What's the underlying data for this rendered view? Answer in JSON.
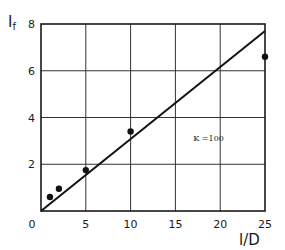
{
  "chart_data": {
    "type": "scatter",
    "title": "",
    "xlabel": "l/D",
    "ylabel": "I_f",
    "xlim": [
      0,
      25
    ],
    "ylim": [
      0,
      8
    ],
    "x_ticks": [
      "0",
      "5",
      "10",
      "15",
      "20",
      "25"
    ],
    "y_ticks": [
      "2",
      "4",
      "6",
      "8"
    ],
    "grid": true,
    "series": [
      {
        "name": "measured",
        "kind": "points",
        "x": [
          1,
          2,
          5,
          10,
          25
        ],
        "y": [
          0.6,
          0.95,
          1.75,
          3.4,
          6.6
        ]
      },
      {
        "name": "fit",
        "kind": "line",
        "x": [
          0,
          25
        ],
        "y": [
          0,
          7.7
        ]
      }
    ],
    "annotations": [
      {
        "text": "K =100",
        "x": 17,
        "y": 3.0
      }
    ],
    "legend": "none"
  }
}
